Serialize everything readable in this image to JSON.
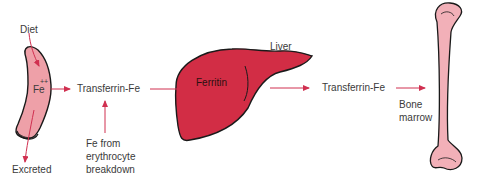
{
  "diagram": {
    "type": "iron-metabolism-flow",
    "colors": {
      "arrow": "#d03050",
      "intestine_fill": "#eea0a8",
      "liver_fill": "#d22d45",
      "bone_fill": "#f2b0b8",
      "outline": "#1a1a1a",
      "text": "#3a3a3a"
    },
    "labels": {
      "diet": "Diet",
      "fe": "Fe",
      "fe_charge": "++",
      "excreted": "Excreted",
      "transferrin_1": "Transferrin-Fe",
      "fe_from_line1": "Fe from",
      "fe_from_line2": "erythrocyte",
      "fe_from_line3": "breakdown",
      "liver": "Liver",
      "ferritin": "Ferritin",
      "transferrin_2": "Transferrin-Fe",
      "bone_line1": "Bone",
      "bone_line2": "marrow"
    },
    "nodes": [
      {
        "id": "intestine",
        "label": "Fe++"
      },
      {
        "id": "transferrin-1",
        "label": "Transferrin-Fe"
      },
      {
        "id": "liver",
        "label": "Liver",
        "contains": "Ferritin"
      },
      {
        "id": "transferrin-2",
        "label": "Transferrin-Fe"
      },
      {
        "id": "bone-marrow",
        "label": "Bone marrow"
      }
    ],
    "edges": [
      {
        "from": "Diet",
        "to": "intestine"
      },
      {
        "from": "intestine",
        "to": "Excreted"
      },
      {
        "from": "intestine",
        "to": "transferrin-1"
      },
      {
        "from": "Fe from erythrocyte breakdown",
        "to": "transferrin-1"
      },
      {
        "from": "transferrin-1",
        "to": "liver"
      },
      {
        "from": "liver",
        "to": "transferrin-2"
      },
      {
        "from": "transferrin-2",
        "to": "bone-marrow"
      }
    ]
  }
}
